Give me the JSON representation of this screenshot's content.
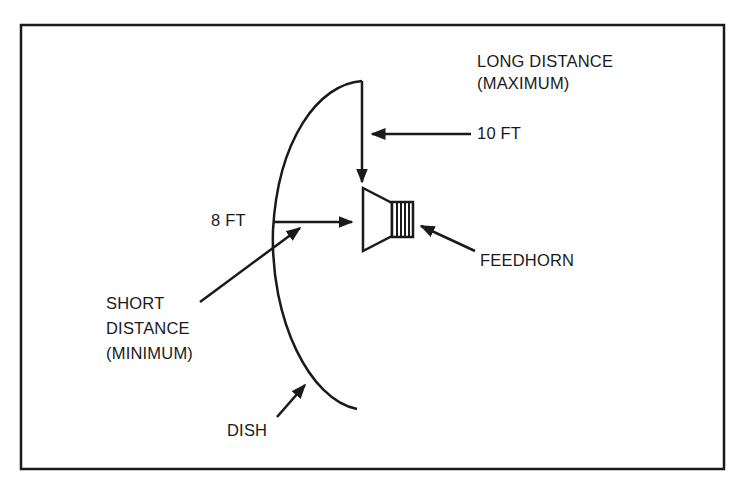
{
  "diagram": {
    "labels": {
      "long_distance_line1": "LONG DISTANCE",
      "long_distance_line2": "(MAXIMUM)",
      "ten_ft": "10 FT",
      "eight_ft": "8 FT",
      "feedhorn": "FEEDHORN",
      "short_distance_line1": "SHORT",
      "short_distance_line2": "DISTANCE",
      "short_distance_line3": "(MINIMUM)",
      "dish": "DISH"
    },
    "components": [
      "dish",
      "feedhorn",
      "frame-border"
    ],
    "measurements": [
      {
        "name": "long distance (maximum)",
        "value": "10 FT"
      },
      {
        "name": "short distance (minimum)",
        "value": "8 FT"
      }
    ],
    "colors": {
      "ink": "#1a1a1a",
      "background": "#ffffff"
    }
  }
}
